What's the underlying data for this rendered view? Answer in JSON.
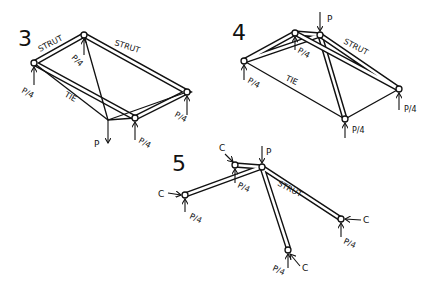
{
  "figures": [
    {
      "number": "3",
      "labels": {
        "strut_left": "STRUT",
        "strut_right": "STRUT",
        "tie": "TIE",
        "load": "P",
        "reaction_top": "P/4",
        "reaction_left": "P/4",
        "reaction_bottom": "P/4",
        "reaction_right": "P/4"
      }
    },
    {
      "number": "4",
      "labels": {
        "load": "P",
        "strut": "STRUT",
        "tie": "TIE",
        "reaction_top": "P/4",
        "reaction_left": "P/4",
        "reaction_bottom": "P/4",
        "reaction_right": "P/4"
      }
    },
    {
      "number": "5",
      "labels": {
        "load": "P",
        "strut": "STRUT",
        "c_top": "C",
        "c_left": "C",
        "c_right": "C",
        "c_bottom": "C",
        "reaction_top": "P/4",
        "reaction_left": "P/4",
        "reaction_right": "P/4",
        "reaction_bottom": "P/4"
      }
    }
  ]
}
